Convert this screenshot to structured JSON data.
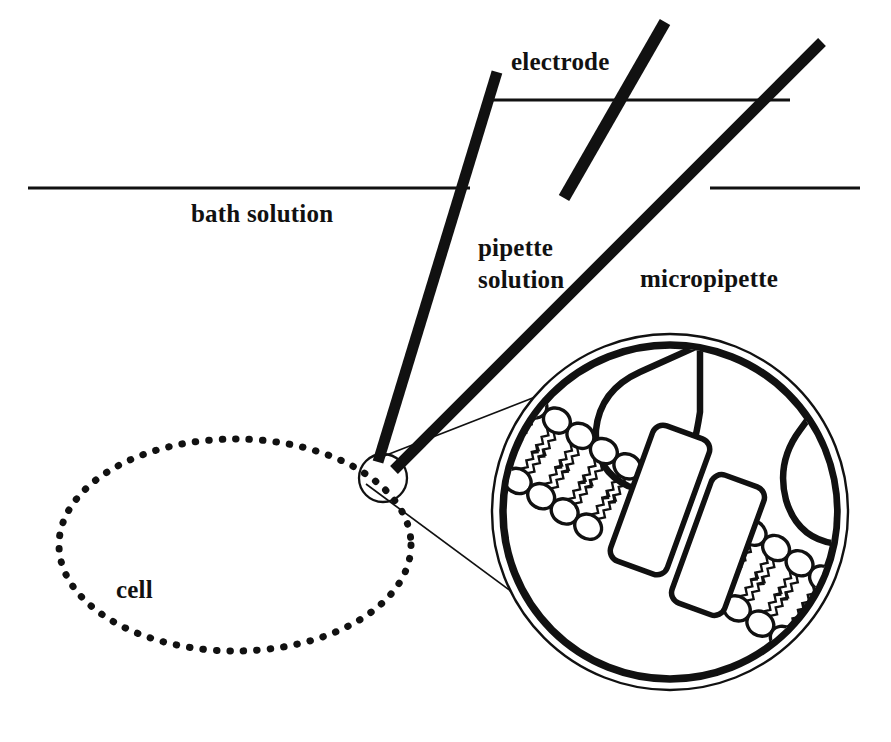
{
  "figure": {
    "background_color": "#ffffff",
    "ink_color": "#111111",
    "width": 891,
    "height": 742
  },
  "labels": {
    "electrode": "electrode",
    "bath_solution": "bath solution",
    "pipette_solution_line1": "pipette",
    "pipette_solution_line2": "solution",
    "micropipette": "micropipette",
    "cell": "cell"
  },
  "elements": {
    "bath_surface_left": "bath-solution-surface-left",
    "bath_surface_right": "bath-solution-surface-right",
    "pipette_surface": "pipette-solution-surface",
    "pipette_wall_left": "micropipette-wall-left",
    "pipette_wall_right": "micropipette-wall-right",
    "electrode_bar": "electrode-wire",
    "cell_outline": "cell-membrane-outline",
    "tip_circle": "pipette-tip-patch-circle",
    "magnifier_outer": "magnifier-outer-ring",
    "magnifier_inner": "magnifier-inner-ring",
    "leader_upper": "magnifier-leader-line-upper",
    "leader_lower": "magnifier-leader-line-lower",
    "bilayer_upper": "lipid-bilayer-upper-left",
    "bilayer_lower": "lipid-bilayer-lower-right",
    "channel_left": "ion-channel-subunit-left",
    "channel_right": "ion-channel-subunit-right",
    "glass_tip_top": "pipette-glass-tip-top",
    "glass_tip_right": "pipette-glass-tip-right"
  },
  "geometry": {
    "bath_surface_y": 188,
    "bath_left_x1": 28,
    "bath_left_x2": 470,
    "bath_right_x1": 710,
    "bath_right_x2": 860,
    "pipette_surface_y": 100,
    "pipette_surface_x1": 490,
    "pipette_surface_x2": 790,
    "cell_center_x": 235,
    "cell_center_y": 545,
    "cell_rx": 176,
    "cell_ry": 106,
    "tip_circle_cx": 383,
    "tip_circle_cy": 478,
    "tip_circle_r": 24,
    "magnifier_cx": 670,
    "magnifier_cy": 512,
    "magnifier_outer_r": 178,
    "magnifier_inner_r": 167,
    "bilayer_angle_deg": 33
  }
}
